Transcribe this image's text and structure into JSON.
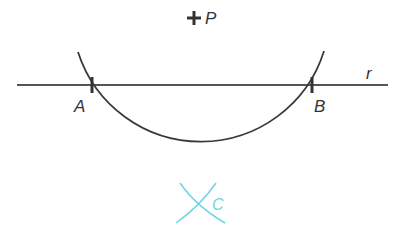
{
  "diagram": {
    "point_p": {
      "label": "P",
      "marker": "plus-mark"
    },
    "line_r": {
      "label": "r"
    },
    "point_a": {
      "label": "A"
    },
    "point_b": {
      "label": "B"
    },
    "point_c": {
      "label": "C"
    },
    "colors": {
      "ink": "#333333",
      "construction": "#6fd3e6"
    }
  }
}
